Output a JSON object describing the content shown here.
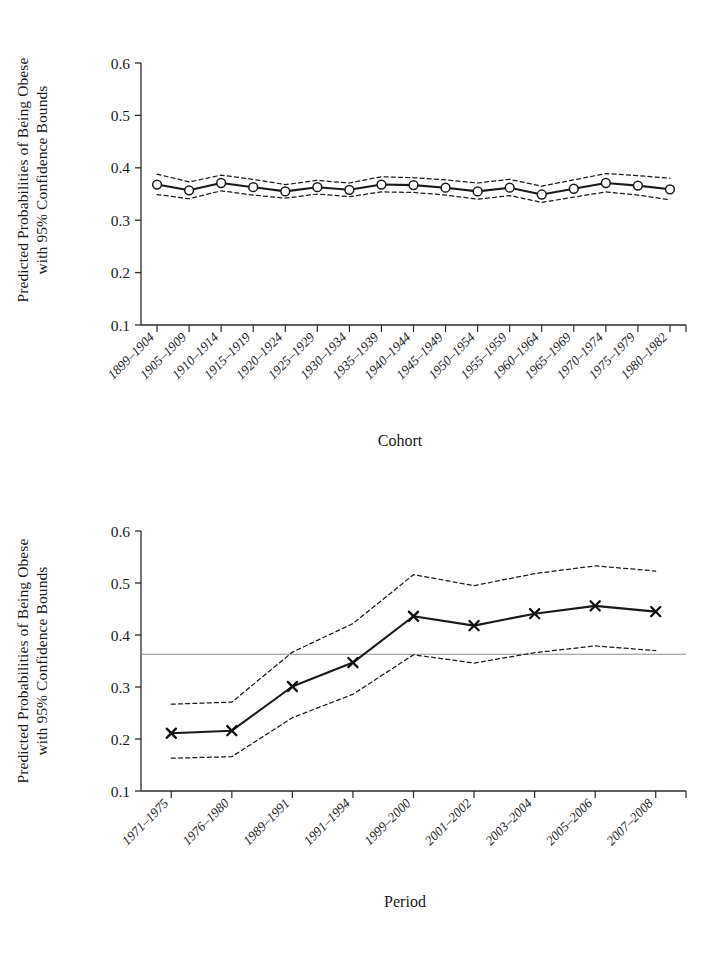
{
  "figure": {
    "panels": [
      "cohort-panel",
      "period-panel"
    ]
  },
  "chart_data": [
    {
      "id": "cohort",
      "type": "line",
      "title": "",
      "xlabel": "Cohort",
      "ylabel": "Predicted Probabilities of Being Obese with 95% Confidence Bounds",
      "ylabel_line1": "Predicted Probabilities of Being Obese",
      "ylabel_line2": "with 95% Confidence Bounds",
      "ylim": [
        0.1,
        0.6
      ],
      "yticks": [
        "0.1",
        "0.2",
        "0.3",
        "0.4",
        "0.5",
        "0.6"
      ],
      "ytick_values": [
        0.1,
        0.2,
        0.3,
        0.4,
        0.5,
        0.6
      ],
      "grid": false,
      "legend": "none",
      "marker": "open-circle",
      "categories": [
        "1899–1904",
        "1905–1909",
        "1910–1914",
        "1915–1919",
        "1920–1924",
        "1925–1929",
        "1930–1934",
        "1935–1939",
        "1940–1944",
        "1945–1949",
        "1950–1954",
        "1955–1959",
        "1960–1964",
        "1965–1969",
        "1970–1974",
        "1975–1979",
        "1980–1982"
      ],
      "series": [
        {
          "name": "Predicted probability",
          "style": "solid",
          "values": [
            0.368,
            0.357,
            0.371,
            0.363,
            0.355,
            0.363,
            0.358,
            0.368,
            0.367,
            0.362,
            0.355,
            0.362,
            0.349,
            0.36,
            0.371,
            0.366,
            0.359
          ]
        },
        {
          "name": "Upper 95% bound",
          "style": "dashed",
          "values": [
            0.388,
            0.373,
            0.386,
            0.378,
            0.368,
            0.376,
            0.371,
            0.383,
            0.381,
            0.377,
            0.371,
            0.378,
            0.365,
            0.377,
            0.389,
            0.385,
            0.38
          ]
        },
        {
          "name": "Lower 95% bound",
          "style": "dashed",
          "values": [
            0.349,
            0.341,
            0.356,
            0.348,
            0.342,
            0.35,
            0.345,
            0.354,
            0.353,
            0.348,
            0.34,
            0.347,
            0.334,
            0.344,
            0.354,
            0.348,
            0.339
          ]
        }
      ]
    },
    {
      "id": "period",
      "type": "line",
      "title": "",
      "xlabel": "Period",
      "ylabel": "Predicted Probabilities of Being Obese with 95% Confidence Bounds",
      "ylabel_line1": "Predicted Probabilities of Being Obese",
      "ylabel_line2": "with 95% Confidence Bounds",
      "ylim": [
        0.1,
        0.6
      ],
      "yticks": [
        "0.1",
        "0.2",
        "0.3",
        "0.4",
        "0.5",
        "0.6"
      ],
      "ytick_values": [
        0.1,
        0.2,
        0.3,
        0.4,
        0.5,
        0.6
      ],
      "grid": false,
      "legend": "none",
      "marker": "x-cross",
      "reference_line": 0.363,
      "categories": [
        "1971–1975",
        "1976–1980",
        "1989–1991",
        "1991–1994",
        "1999–2000",
        "2001–2002",
        "2003–2004",
        "2005–2006",
        "2007–2008"
      ],
      "series": [
        {
          "name": "Predicted probability",
          "style": "solid",
          "values": [
            0.211,
            0.216,
            0.301,
            0.347,
            0.436,
            0.418,
            0.441,
            0.456,
            0.445
          ]
        },
        {
          "name": "Upper 95% bound",
          "style": "dashed",
          "values": [
            0.267,
            0.271,
            0.367,
            0.422,
            0.516,
            0.495,
            0.518,
            0.533,
            0.523
          ]
        },
        {
          "name": "Lower 95% bound",
          "style": "dashed",
          "values": [
            0.163,
            0.166,
            0.241,
            0.286,
            0.362,
            0.346,
            0.366,
            0.379,
            0.37
          ]
        }
      ]
    }
  ]
}
